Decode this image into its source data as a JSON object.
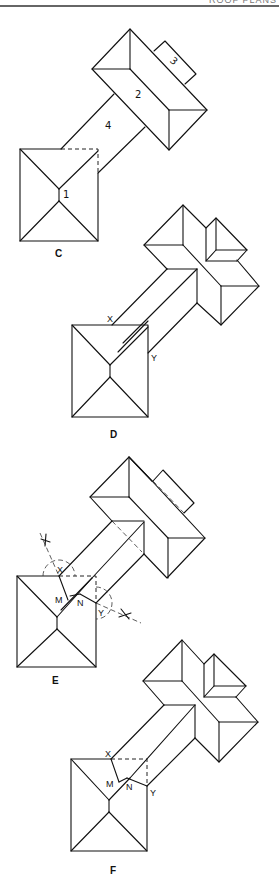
{
  "header": {
    "text": "ROOF PLANS"
  },
  "figures": [
    {
      "id": "C",
      "caption": "C",
      "part_labels": [
        "1",
        "2",
        "3",
        "4"
      ]
    },
    {
      "id": "D",
      "caption": "D",
      "point_labels": [
        "X",
        "Y"
      ]
    },
    {
      "id": "E",
      "caption": "E",
      "point_labels": [
        "X",
        "Y",
        "M",
        "N"
      ]
    },
    {
      "id": "F",
      "caption": "F",
      "point_labels": [
        "X",
        "Y",
        "M",
        "N"
      ]
    }
  ]
}
